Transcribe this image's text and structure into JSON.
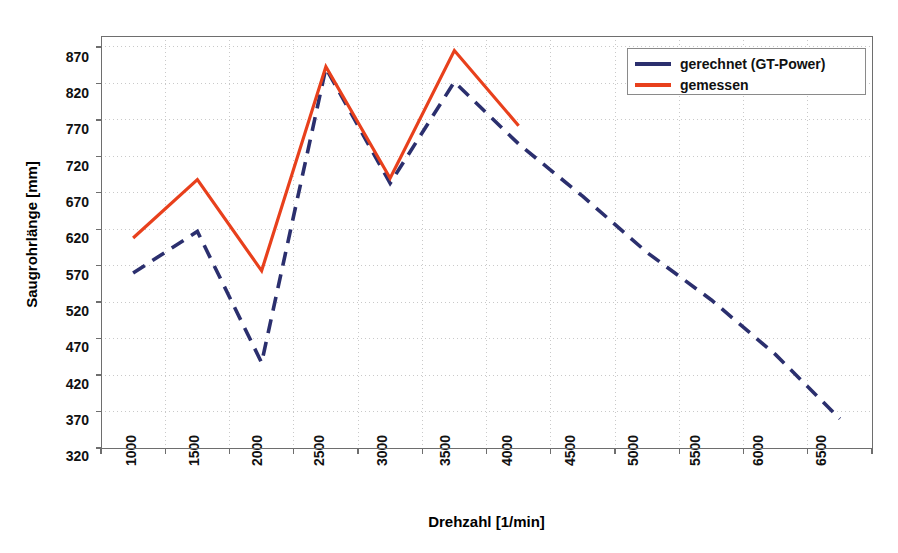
{
  "chart_data": {
    "type": "line",
    "title": "",
    "xlabel": "Drehzahl [1/min]",
    "ylabel": "Saugrohrlänge [mm]",
    "xticks": [
      1000,
      1500,
      2000,
      2500,
      3000,
      3500,
      4000,
      4500,
      5000,
      5500,
      6000,
      6500
    ],
    "yticks": [
      320,
      370,
      420,
      470,
      520,
      570,
      620,
      670,
      720,
      770,
      820,
      870
    ],
    "ylim": [
      320,
      885
    ],
    "xlim": [
      1000,
      6500
    ],
    "grid": true,
    "grid_style": "dotted",
    "legend_position": "top-right",
    "series": [
      {
        "name": "gerechnet (GT-Power)",
        "color": "#2b2f6e",
        "style": "dashed",
        "x": [
          1000,
          1500,
          2000,
          2500,
          3000,
          3500,
          4000,
          4500,
          5000,
          5500,
          6000,
          6500
        ],
        "values": [
          560,
          617,
          437,
          841,
          683,
          822,
          737,
          665,
          588,
          523,
          448,
          360
        ]
      },
      {
        "name": "gemessen",
        "color": "#e8401c",
        "style": "solid",
        "x": [
          1000,
          1500,
          2000,
          2500,
          3000,
          3500,
          4000
        ],
        "values": [
          608,
          688,
          563,
          843,
          690,
          865,
          762
        ]
      }
    ]
  },
  "axes": {
    "y_title": "Saugrohrlänge [mm]",
    "x_title": "Drehzahl [1/min]",
    "y_tick_labels": [
      "870",
      "820",
      "770",
      "720",
      "670",
      "620",
      "570",
      "520",
      "470",
      "420",
      "370",
      "320"
    ],
    "x_tick_labels": [
      "1000",
      "1500",
      "2000",
      "2500",
      "3000",
      "3500",
      "4000",
      "4500",
      "5000",
      "5500",
      "6000",
      "6500"
    ]
  },
  "legend": {
    "entries": [
      {
        "label": "gerechnet (GT-Power)",
        "color": "#2b2f6e",
        "style": "dashed"
      },
      {
        "label": "gemessen",
        "color": "#e8401c",
        "style": "solid"
      }
    ]
  },
  "colors": {
    "computed_line": "#2b2f6e",
    "measured_line": "#e8401c",
    "axis": "#6e6e6e",
    "grid": "#c9c9c9",
    "background": "#ffffff"
  }
}
